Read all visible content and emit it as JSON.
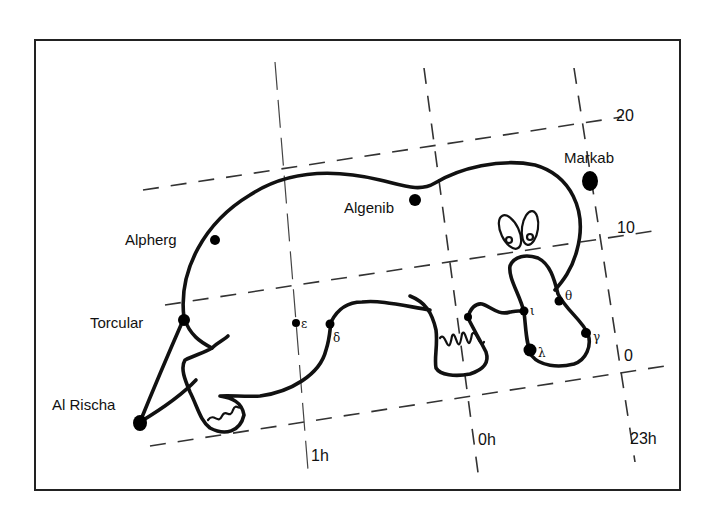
{
  "diagram": {
    "type": "constellation-chart",
    "colors": {
      "ink": "#111111",
      "background": "#ffffff",
      "grid": "#333333"
    },
    "stars_named": [
      {
        "name": "Markab",
        "label": "Markab"
      },
      {
        "name": "Algenib",
        "label": "Algenib"
      },
      {
        "name": "Alpherg",
        "label": "Alpherg"
      },
      {
        "name": "Torcular",
        "label": "Torcular"
      },
      {
        "name": "Al Rischa",
        "label": "Al Rischa"
      }
    ],
    "stars_greek": [
      {
        "name": "epsilon",
        "label": "ε"
      },
      {
        "name": "delta",
        "label": "δ"
      },
      {
        "name": "iota",
        "label": "ι"
      },
      {
        "name": "theta",
        "label": "θ"
      },
      {
        "name": "gamma",
        "label": "γ"
      },
      {
        "name": "lambda",
        "label": "λ"
      }
    ],
    "declination_labels": [
      "20",
      "10",
      "0"
    ],
    "right_ascension_labels": [
      "1h",
      "0h",
      "23h"
    ]
  }
}
